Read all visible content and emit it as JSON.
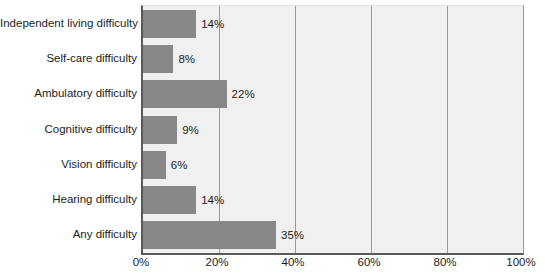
{
  "chart_data": {
    "type": "bar",
    "orientation": "horizontal",
    "title": "",
    "subtitle": "",
    "xlabel": "",
    "ylabel": "",
    "xlim": [
      0,
      100
    ],
    "grid": true,
    "legend": false,
    "x_tick_labels": [
      "0%",
      "20%",
      "40%",
      "60%",
      "80%",
      "100%"
    ],
    "x_tick_values": [
      0,
      20,
      40,
      60,
      80,
      100
    ],
    "categories": [
      "Independent living difficulty",
      "Self-care difficulty",
      "Ambulatory difficulty",
      "Cognitive difficulty",
      "Vision difficulty",
      "Hearing difficulty",
      "Any difficulty"
    ],
    "values": [
      14,
      8,
      22,
      9,
      6,
      14,
      35
    ],
    "data_labels": [
      "14%",
      "8%",
      "22%",
      "9%",
      "6%",
      "14%",
      "35%"
    ],
    "colors": {
      "bar_fill": "#878787",
      "plot_background": "#f0f0f0",
      "gridline": "#9a9a9a",
      "axis_line": "#5a5a5a",
      "text": "#1d1d1d",
      "page_background": "#ffffff"
    }
  }
}
